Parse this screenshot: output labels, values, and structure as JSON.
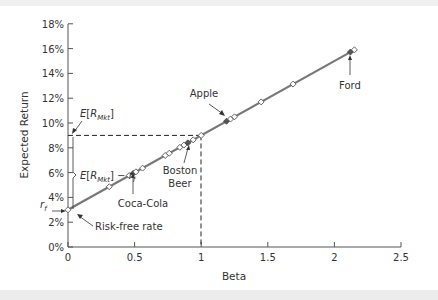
{
  "chart_data": {
    "type": "line",
    "title": "",
    "xlabel": "Beta",
    "ylabel": "Expected Return",
    "xlim": [
      0,
      2.5
    ],
    "ylim": [
      0,
      18
    ],
    "x_ticks": [
      "0",
      "0.5",
      "1",
      "1.5",
      "2",
      "2.5"
    ],
    "y_ticks": [
      "0%",
      "2%",
      "4%",
      "6%",
      "8%",
      "10%",
      "12%",
      "14%",
      "16%",
      "18%"
    ],
    "grid": false,
    "series": [
      {
        "name": "Security Market Line",
        "line": {
          "x": [
            0,
            2.15
          ],
          "y": [
            3.0,
            15.9
          ]
        },
        "points": [
          {
            "beta": 0.0,
            "ret": 3.0,
            "filled": false
          },
          {
            "beta": 0.31,
            "ret": 4.86,
            "filled": false
          },
          {
            "beta": 0.46,
            "ret": 5.76,
            "filled": false
          },
          {
            "beta": 0.49,
            "ret": 5.94,
            "filled": true
          },
          {
            "beta": 0.51,
            "ret": 6.06,
            "filled": false
          },
          {
            "beta": 0.56,
            "ret": 6.36,
            "filled": false
          },
          {
            "beta": 0.73,
            "ret": 7.38,
            "filled": false
          },
          {
            "beta": 0.76,
            "ret": 7.56,
            "filled": false
          },
          {
            "beta": 0.84,
            "ret": 8.04,
            "filled": false
          },
          {
            "beta": 0.87,
            "ret": 8.22,
            "filled": false
          },
          {
            "beta": 0.9,
            "ret": 8.4,
            "filled": true
          },
          {
            "beta": 0.94,
            "ret": 8.64,
            "filled": false
          },
          {
            "beta": 1.0,
            "ret": 9.0,
            "filled": false
          },
          {
            "beta": 1.19,
            "ret": 10.14,
            "filled": true
          },
          {
            "beta": 1.22,
            "ret": 10.32,
            "filled": false
          },
          {
            "beta": 1.25,
            "ret": 10.5,
            "filled": false
          },
          {
            "beta": 1.45,
            "ret": 11.7,
            "filled": false
          },
          {
            "beta": 1.69,
            "ret": 13.14,
            "filled": false
          },
          {
            "beta": 2.12,
            "ret": 15.72,
            "filled": true
          },
          {
            "beta": 2.15,
            "ret": 15.9,
            "filled": false
          }
        ]
      }
    ],
    "annotations": [
      {
        "text": "Ford",
        "beta": 2.12
      },
      {
        "text": "Apple",
        "beta": 1.19
      },
      {
        "text": "Boston Beer",
        "beta": 0.9
      },
      {
        "text": "Coca-Cola",
        "beta": 0.49
      },
      {
        "text": "Risk-free rate",
        "beta": 0.0
      },
      {
        "text": "E[R_Mkt]",
        "value": 9.0
      },
      {
        "text": "E[R_Mkt] − r_f",
        "range": [
          3.0,
          9.0
        ]
      },
      {
        "text": "r_f",
        "value": 3.0
      }
    ],
    "reference_lines": [
      {
        "type": "horizontal-dashed",
        "y": 9.0,
        "x_range": [
          0,
          1
        ]
      },
      {
        "type": "vertical-dashed",
        "x": 1.0,
        "y_range": [
          0,
          9.0
        ]
      }
    ]
  },
  "labels": {
    "ylabel": "Expected Return",
    "xlabel": "Beta",
    "ford": "Ford",
    "apple": "Apple",
    "boston1": "Boston",
    "boston2": "Beer",
    "coke": "Coca-Cola",
    "rf_label": "Risk-free rate",
    "emkt_E": "E",
    "emkt_sub": "Mkt",
    "rf_r": "r",
    "rf_sub": "f"
  }
}
